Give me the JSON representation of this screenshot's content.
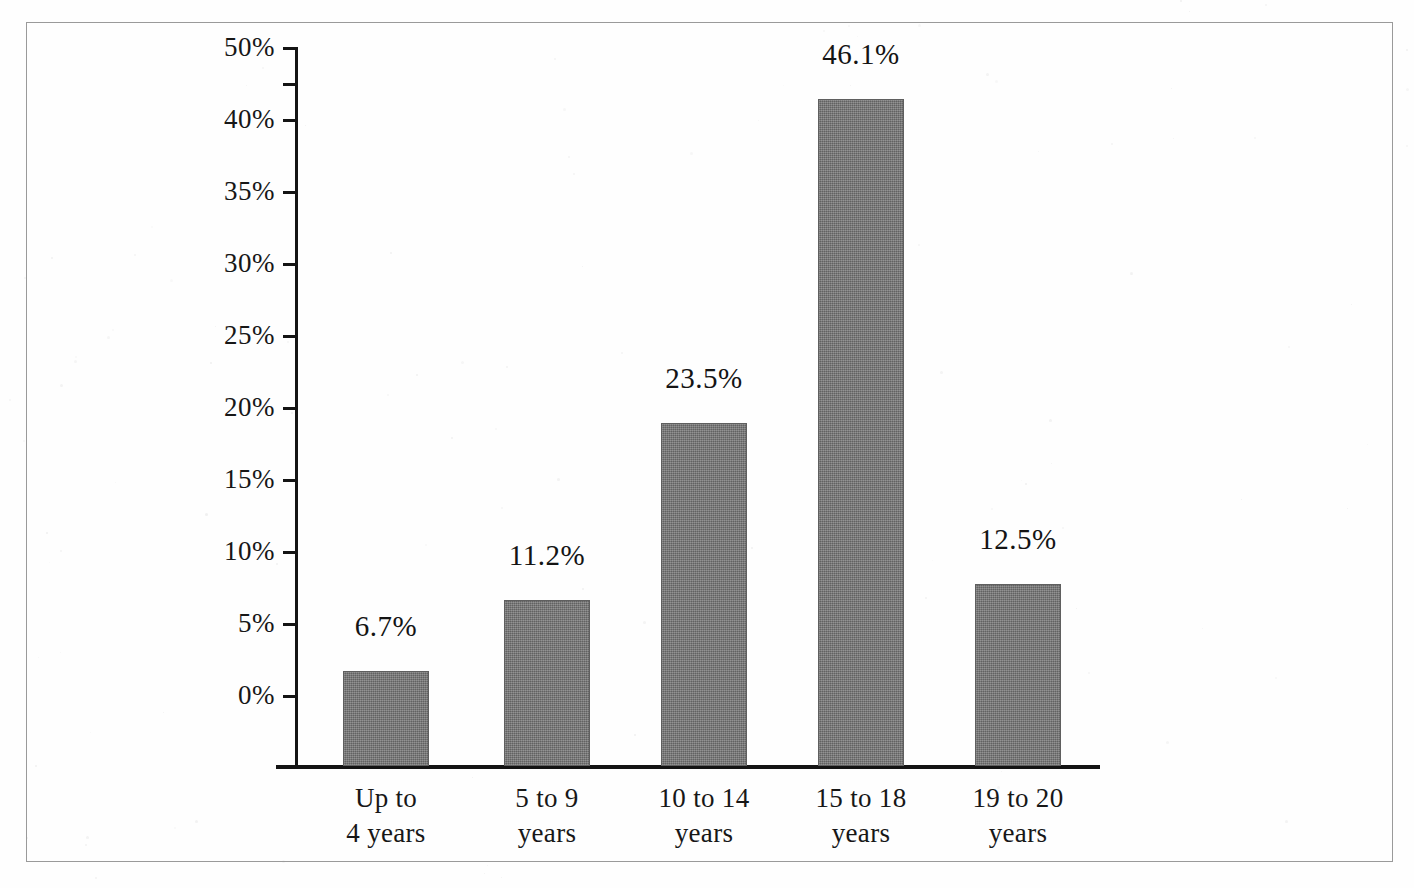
{
  "chart_data": {
    "type": "bar",
    "title": "",
    "subtitle": "",
    "xlabel": "",
    "ylabel": "",
    "categories": [
      "Up to\n4 years",
      "5 to 9\nyears",
      "10 to 14\nyears",
      "15 to 18\nyears",
      "19 to 20\nyears"
    ],
    "values": [
      6.7,
      11.2,
      23.5,
      46.1,
      12.5
    ],
    "value_labels": [
      "6.7%",
      "11.2%",
      "23.5%",
      "46.1%",
      "12.5%"
    ],
    "ylim": [
      0,
      50
    ],
    "ytick_values": [
      0,
      5,
      10,
      15,
      20,
      25,
      30,
      35,
      40,
      50
    ],
    "ytick_labels": [
      "0%",
      "5%",
      "10%",
      "15%",
      "20%",
      "25%",
      "30%",
      "35%",
      "40%",
      "50%"
    ],
    "unlabeled_tick_values": [
      45
    ],
    "grid": false,
    "legend": null,
    "bar_color": "#787878",
    "axis_color": "#141414",
    "text_color": "#171717",
    "background_color": "#ffffff",
    "frame_color": "#9a9a9a",
    "note": "Broken y-axis: the 45% gridline position carries no tick mark and no label; the gap between the 40% and 50% labels is twice the normal tick spacing."
  },
  "axis": {
    "ticks": [
      {
        "label": "50%",
        "value": 50,
        "y": 47,
        "labeled": true
      },
      {
        "label": "",
        "value": 45,
        "y": 83,
        "labeled": false
      },
      {
        "label": "40%",
        "value": 40,
        "y": 119,
        "labeled": true
      },
      {
        "label": "35%",
        "value": 35,
        "y": 191,
        "labeled": true
      },
      {
        "label": "30%",
        "value": 30,
        "y": 263,
        "labeled": true
      },
      {
        "label": "25%",
        "value": 25,
        "y": 335,
        "labeled": true
      },
      {
        "label": "20%",
        "value": 20,
        "y": 407,
        "labeled": true
      },
      {
        "label": "15%",
        "value": 15,
        "y": 479,
        "labeled": true
      },
      {
        "label": "10%",
        "value": 10,
        "y": 551,
        "labeled": true
      },
      {
        "label": "5%",
        "value": 5,
        "y": 623,
        "labeled": true
      },
      {
        "label": "0%",
        "value": 0,
        "y": 695,
        "labeled": true
      }
    ]
  },
  "bars": [
    {
      "category": "Up to\n4 years",
      "label": "6.7%",
      "value": 6.7,
      "left": 343,
      "width": 86,
      "top": 671,
      "height": 95,
      "label_top": 612,
      "cat_left": 313,
      "cat_width": 146
    },
    {
      "category": "5 to 9\nyears",
      "label": "11.2%",
      "value": 11.2,
      "left": 504,
      "width": 86,
      "top": 600,
      "height": 166,
      "label_top": 541,
      "cat_left": 474,
      "cat_width": 146
    },
    {
      "category": "10 to 14\nyears",
      "label": "23.5%",
      "value": 23.5,
      "left": 661,
      "width": 86,
      "top": 423,
      "height": 343,
      "label_top": 364,
      "cat_left": 631,
      "cat_width": 146
    },
    {
      "category": "15 to 18\nyears",
      "label": "46.1%",
      "value": 46.1,
      "left": 818,
      "width": 86,
      "top": 99,
      "height": 667,
      "label_top": 40,
      "cat_left": 788,
      "cat_width": 146
    },
    {
      "category": "19 to 20\nyears",
      "label": "12.5%",
      "value": 12.5,
      "left": 975,
      "width": 86,
      "top": 584,
      "height": 182,
      "label_top": 525,
      "cat_left": 945,
      "cat_width": 146
    }
  ]
}
